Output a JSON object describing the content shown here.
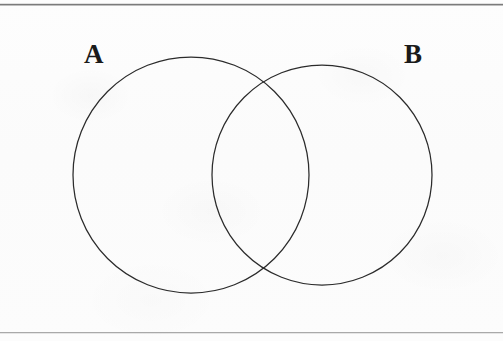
{
  "figure": {
    "type": "venn-diagram",
    "title": "",
    "background_color": "#fcfcfc",
    "stroke_color": "#2b2b2b",
    "rules": {
      "top_color": "#7b7b7b",
      "bottom_color": "#a9a9a9"
    }
  },
  "labels": {
    "set_a": "A",
    "set_b": "B"
  },
  "chart_data": {
    "type": "diagram",
    "subtype": "venn",
    "title": "",
    "sets": [
      {
        "name": "A",
        "label": "A",
        "center_x": 191,
        "center_y": 175,
        "radius": 118,
        "fill": "none",
        "stroke": "#2b2b2b"
      },
      {
        "name": "B",
        "label": "B",
        "center_x": 322,
        "center_y": 175,
        "radius": 110,
        "fill": "none",
        "stroke": "#2b2b2b"
      }
    ],
    "overlap": {
      "present": true,
      "shaded": false,
      "label": "",
      "intersection_points": [
        {
          "x": 258,
          "y": 72
        },
        {
          "x": 258,
          "y": 277
        }
      ]
    },
    "label_positions": [
      {
        "text": "A",
        "x": 88,
        "y": 54
      },
      {
        "text": "B",
        "x": 408,
        "y": 54
      }
    ],
    "universe_box": {
      "drawn": false
    },
    "annotations": []
  }
}
